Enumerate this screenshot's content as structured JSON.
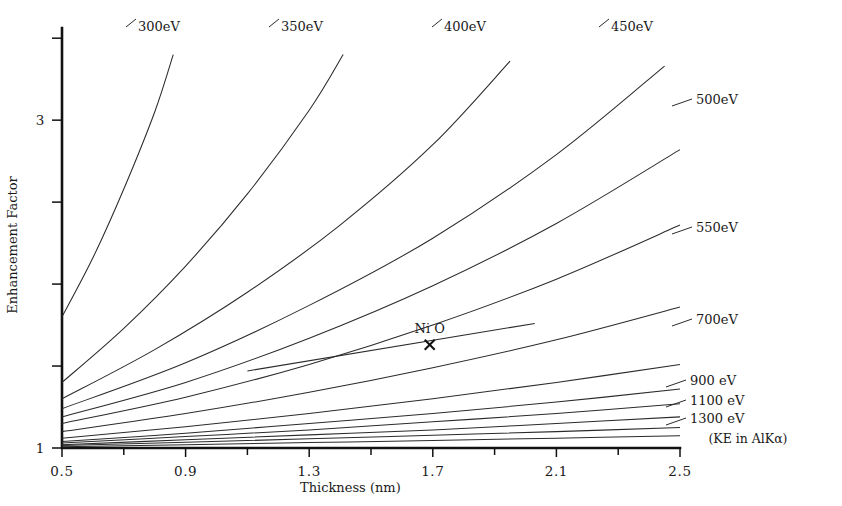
{
  "chart_data": {
    "type": "line",
    "title": "",
    "xlabel": "Thickness (nm)",
    "ylabel": "Enhancement Factor",
    "xlim": [
      0.5,
      2.5
    ],
    "ylim": [
      1.0,
      3.55
    ],
    "grid": false,
    "legend_position": "inline-end-of-line",
    "x_ticks": [
      0.5,
      0.9,
      1.3,
      1.7,
      2.1,
      2.5
    ],
    "x_tick_labels": [
      "0.5",
      "0.9",
      "1.3",
      "1.7",
      "2.1",
      "2.5"
    ],
    "x_minor_ticks": [
      0.7,
      1.1,
      1.5,
      1.9,
      2.3
    ],
    "y_ticks": [
      1,
      1.5,
      2,
      2.5,
      3,
      3.5
    ],
    "y_tick_labels": [
      "1",
      "",
      "",
      "",
      "3",
      ""
    ],
    "annotation_note": "(KE in AlKα)",
    "point_annotations": [
      {
        "label": "Ni O",
        "x": 1.69,
        "y": 1.63,
        "marker": "x"
      }
    ],
    "series": [
      {
        "name": "300eV",
        "label": "300eV",
        "label_x": 138,
        "label_y": 31,
        "values": [
          [
            0.5,
            1.8
          ],
          [
            0.6,
            2.16
          ],
          [
            0.7,
            2.58
          ],
          [
            0.8,
            3.05
          ],
          [
            0.86,
            3.4
          ]
        ]
      },
      {
        "name": "350eV",
        "label": "350eV",
        "label_x": 281,
        "label_y": 31,
        "values": [
          [
            0.5,
            1.4
          ],
          [
            0.7,
            1.73
          ],
          [
            0.9,
            2.11
          ],
          [
            1.1,
            2.55
          ],
          [
            1.3,
            3.06
          ],
          [
            1.41,
            3.4
          ]
        ]
      },
      {
        "name": "400eV",
        "label": "400eV",
        "label_x": 444,
        "label_y": 31,
        "values": [
          [
            0.5,
            1.3
          ],
          [
            0.8,
            1.6
          ],
          [
            1.1,
            1.95
          ],
          [
            1.4,
            2.36
          ],
          [
            1.7,
            2.85
          ],
          [
            1.95,
            3.36
          ]
        ]
      },
      {
        "name": "450eV",
        "label": "450eV",
        "label_x": 611,
        "label_y": 31,
        "values": [
          [
            0.5,
            1.24
          ],
          [
            0.9,
            1.52
          ],
          [
            1.3,
            1.87
          ],
          [
            1.7,
            2.28
          ],
          [
            2.1,
            2.79
          ],
          [
            2.45,
            3.33
          ]
        ]
      },
      {
        "name": "500eV",
        "label": "500eV",
        "label_x": 696,
        "label_y": 104,
        "values": [
          [
            0.5,
            1.19
          ],
          [
            0.9,
            1.4
          ],
          [
            1.3,
            1.67
          ],
          [
            1.7,
            1.99
          ],
          [
            2.1,
            2.37
          ],
          [
            2.5,
            2.82
          ]
        ]
      },
      {
        "name": "550eV",
        "label": "550eV",
        "label_x": 696,
        "label_y": 232,
        "values": [
          [
            0.5,
            1.15
          ],
          [
            0.9,
            1.31
          ],
          [
            1.3,
            1.51
          ],
          [
            1.7,
            1.75
          ],
          [
            2.1,
            2.03
          ],
          [
            2.5,
            2.36
          ]
        ]
      },
      {
        "name": "700eV",
        "label": "700eV",
        "label_x": 696,
        "label_y": 324,
        "values": [
          [
            0.5,
            1.1
          ],
          [
            0.9,
            1.21
          ],
          [
            1.3,
            1.34
          ],
          [
            1.7,
            1.49
          ],
          [
            2.1,
            1.66
          ],
          [
            2.5,
            1.86
          ]
        ]
      },
      {
        "name": "900eV",
        "label": "900 eV",
        "label_x": 690,
        "label_y": 385,
        "values": [
          [
            0.5,
            1.06
          ],
          [
            0.9,
            1.13
          ],
          [
            1.3,
            1.21
          ],
          [
            1.7,
            1.3
          ],
          [
            2.1,
            1.4
          ],
          [
            2.5,
            1.51
          ]
        ]
      },
      {
        "name": "1100eV",
        "label": "1100 eV",
        "label_x": 690,
        "label_y": 405,
        "values": [
          [
            0.5,
            1.04
          ],
          [
            0.9,
            1.09
          ],
          [
            1.3,
            1.15
          ],
          [
            1.7,
            1.21
          ],
          [
            2.1,
            1.28
          ],
          [
            2.5,
            1.36
          ]
        ]
      },
      {
        "name": "1300eV",
        "label": "1300 eV",
        "label_x": 690,
        "label_y": 423,
        "values": [
          [
            0.5,
            1.03
          ],
          [
            0.9,
            1.07
          ],
          [
            1.3,
            1.11
          ],
          [
            1.7,
            1.16
          ],
          [
            2.1,
            1.21
          ],
          [
            2.5,
            1.27
          ]
        ]
      },
      {
        "name": "extra-1",
        "label": "",
        "label_x": 0,
        "label_y": 0,
        "values": [
          [
            0.5,
            1.02
          ],
          [
            0.9,
            1.05
          ],
          [
            1.3,
            1.08
          ],
          [
            1.7,
            1.11
          ],
          [
            2.1,
            1.15
          ],
          [
            2.5,
            1.19
          ]
        ]
      },
      {
        "name": "extra-2",
        "label": "",
        "label_x": 0,
        "label_y": 0,
        "values": [
          [
            0.5,
            1.015
          ],
          [
            0.9,
            1.035
          ],
          [
            1.3,
            1.056
          ],
          [
            1.7,
            1.078
          ],
          [
            2.1,
            1.1
          ],
          [
            2.5,
            1.125
          ]
        ]
      },
      {
        "name": "extra-3",
        "label": "",
        "label_x": 0,
        "label_y": 0,
        "values": [
          [
            0.5,
            1.008
          ],
          [
            0.9,
            1.02
          ],
          [
            1.3,
            1.033
          ],
          [
            1.7,
            1.046
          ],
          [
            2.1,
            1.06
          ],
          [
            2.5,
            1.075
          ]
        ]
      }
    ],
    "nio_segment": {
      "x1": 1.1,
      "y1": 1.47,
      "x2": 2.03,
      "y2": 1.76
    }
  },
  "axes": {
    "y_axis_title": "Enhancement Factor",
    "x_axis_title": "Thickness (nm)"
  },
  "footnote": "(KE in AlKα)"
}
